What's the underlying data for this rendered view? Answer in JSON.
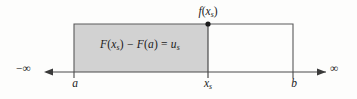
{
  "figure": {
    "background_color": "#fdfdfc",
    "shade_color": "#d2d2d2",
    "line_color": "#4a4a4a",
    "text_color": "#1b1b1b"
  },
  "labels": {
    "function_point": {
      "prefix": "f",
      "open": "(",
      "var": "x",
      "sub": "s",
      "close": ")"
    },
    "area_formula": {
      "f1": "F",
      "open1": "(",
      "var1": "x",
      "sub1": "s",
      "close1": ")",
      "minus": " − ",
      "f2": "F",
      "open2": "(",
      "var2": "a",
      "close2": ")",
      "equals": " = ",
      "u": "u",
      "usub": "s"
    },
    "axis_left_end": "−∞",
    "axis_right_end": "∞",
    "tick_a": "a",
    "tick_xs": {
      "var": "x",
      "sub": "s"
    },
    "tick_b": "b"
  },
  "geometry": {
    "axis_y": 72,
    "rect_left": 74,
    "rect_right": 293,
    "rect_top": 24,
    "shade_right": 208,
    "arrow_left_x": 46,
    "arrow_right_x": 324,
    "point_x": 208,
    "point_y": 24
  }
}
